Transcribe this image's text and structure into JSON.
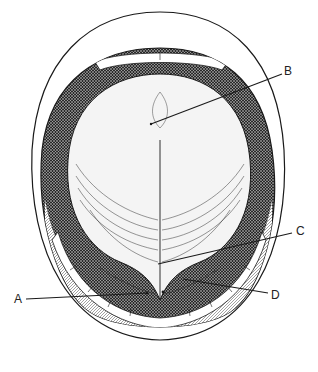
{
  "figure": {
    "colors": {
      "ink": "#1a1a1a",
      "paper": "#ffffff",
      "shade_dark": "#2a2a2a",
      "tongue_fill": "#f4f4f4",
      "floor_fill": "#e6e6e6"
    }
  },
  "labels": [
    {
      "id": "A",
      "text": "A",
      "x": 14,
      "y": 293,
      "line": [
        26,
        299,
        148,
        293
      ]
    },
    {
      "id": "B",
      "text": "B",
      "x": 284,
      "y": 65,
      "line": [
        151,
        124,
        282,
        74
      ]
    },
    {
      "id": "C",
      "text": "C",
      "x": 296,
      "y": 225,
      "line": [
        158,
        264,
        292,
        233
      ]
    },
    {
      "id": "D",
      "text": "D",
      "x": 271,
      "y": 289,
      "line": [
        183,
        279,
        268,
        293
      ]
    }
  ]
}
